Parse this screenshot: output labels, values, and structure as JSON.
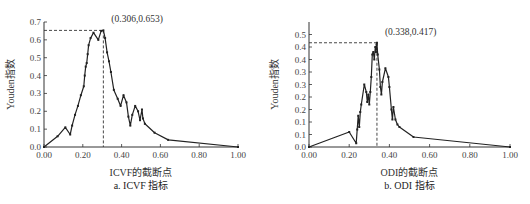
{
  "chart_data": [
    {
      "type": "line",
      "title": "",
      "caption": "a. ICVF 指标",
      "xlabel": "ICVF的截断点",
      "ylabel": "Youden指数",
      "xlim": [
        0,
        1
      ],
      "ylim": [
        0,
        0.7
      ],
      "x_ticks": [
        "0.00",
        "0.20",
        "0.40",
        "0.60",
        "0.80",
        "1.00"
      ],
      "y_ticks": [
        "0.0",
        "0.1",
        "0.2",
        "0.3",
        "0.4",
        "0.5",
        "0.6",
        "0.7"
      ],
      "grid": false,
      "annotation": {
        "label": "(0.306,0.653)",
        "x": 0.306,
        "y": 0.653
      },
      "series": [
        {
          "name": "ICVF",
          "x": [
            0.0,
            0.07,
            0.11,
            0.135,
            0.145,
            0.16,
            0.175,
            0.19,
            0.205,
            0.21,
            0.215,
            0.22,
            0.225,
            0.23,
            0.24,
            0.255,
            0.28,
            0.295,
            0.306,
            0.315,
            0.325,
            0.335,
            0.345,
            0.36,
            0.38,
            0.395,
            0.41,
            0.425,
            0.435,
            0.445,
            0.455,
            0.47,
            0.485,
            0.495,
            0.505,
            0.51,
            0.52,
            0.57,
            0.64,
            1.0
          ],
          "values": [
            0.0,
            0.06,
            0.11,
            0.07,
            0.12,
            0.18,
            0.23,
            0.29,
            0.34,
            0.4,
            0.45,
            0.47,
            0.52,
            0.57,
            0.61,
            0.64,
            0.6,
            0.65,
            0.653,
            0.61,
            0.53,
            0.48,
            0.42,
            0.32,
            0.27,
            0.23,
            0.29,
            0.25,
            0.17,
            0.12,
            0.18,
            0.23,
            0.2,
            0.15,
            0.21,
            0.16,
            0.13,
            0.08,
            0.04,
            0.0
          ]
        }
      ]
    },
    {
      "type": "line",
      "title": "",
      "caption": "b. ODI 指标",
      "xlabel": "ODI的截断点",
      "ylabel": "Youden指数",
      "xlim": [
        0,
        1
      ],
      "ylim": [
        0,
        0.5
      ],
      "x_ticks": [
        "0.00",
        "0.20",
        "0.40",
        "0.60",
        "0.80",
        "1.00"
      ],
      "y_ticks": [
        "0.0",
        "0.1",
        "0.1",
        "0.2",
        "0.2",
        "0.3",
        "0.3",
        "0.4",
        "0.4",
        "0.5"
      ],
      "grid": false,
      "annotation": {
        "label": "(0.338,0.417)",
        "x": 0.338,
        "y": 0.417
      },
      "series": [
        {
          "name": "ODI",
          "x": [
            0.0,
            0.2,
            0.235,
            0.24,
            0.245,
            0.25,
            0.255,
            0.26,
            0.275,
            0.285,
            0.29,
            0.295,
            0.3,
            0.305,
            0.31,
            0.315,
            0.32,
            0.325,
            0.33,
            0.333,
            0.336,
            0.338,
            0.342,
            0.35,
            0.355,
            0.36,
            0.365,
            0.38,
            0.395,
            0.4,
            0.41,
            0.415,
            0.42,
            0.43,
            0.44,
            0.45,
            0.52,
            1.0
          ],
          "values": [
            0.0,
            0.06,
            0.015,
            0.07,
            0.125,
            0.08,
            0.14,
            0.17,
            0.25,
            0.22,
            0.18,
            0.21,
            0.17,
            0.22,
            0.28,
            0.37,
            0.38,
            0.35,
            0.4,
            0.38,
            0.41,
            0.417,
            0.37,
            0.31,
            0.24,
            0.21,
            0.26,
            0.315,
            0.28,
            0.24,
            0.15,
            0.11,
            0.16,
            0.11,
            0.09,
            0.08,
            0.04,
            0.0
          ]
        }
      ]
    }
  ]
}
